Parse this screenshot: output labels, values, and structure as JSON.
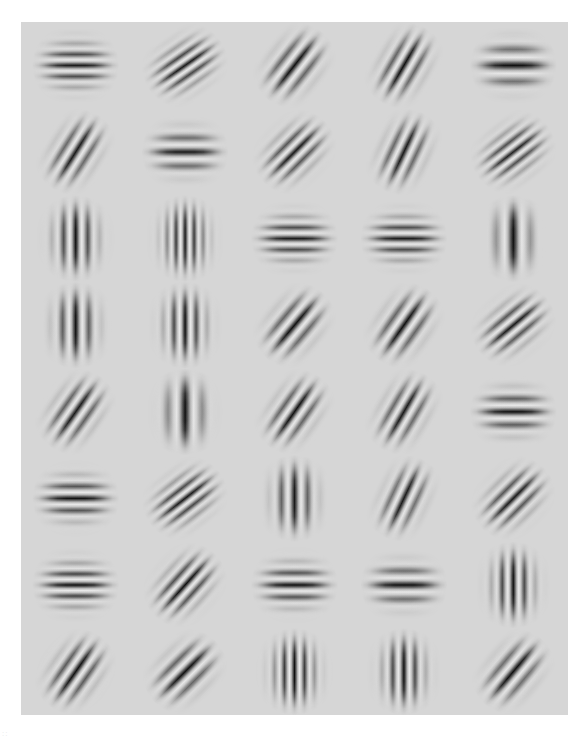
{
  "figure": {
    "kind": "gabor-filter-bank",
    "panel_background": "#d6d6d6",
    "page_background": "#ffffff",
    "panel": {
      "x": 21,
      "y": 22,
      "width": 547,
      "height": 693
    },
    "corner_mark": "::"
  },
  "chart_data": {
    "type": "heatmap",
    "title": "",
    "subtitle": "",
    "xlabel": "",
    "ylabel": "",
    "grid": false,
    "legend": "none",
    "rows": 8,
    "cols": 5,
    "cell_width": 109.4,
    "cell_height": 86.6,
    "patch_radius": 30,
    "background_level": 0.84,
    "orientation_units": "degrees (0 = horizontal bands, 90 = vertical bands, negative = bands tilted from lower-left to upper-right)",
    "patches": [
      {
        "row": 0,
        "col": 0,
        "orientation": 0,
        "bands": 5,
        "wavelength": 11,
        "sigma": 16,
        "amplitude": 0.95,
        "kind": "horizontal"
      },
      {
        "row": 0,
        "col": 1,
        "orientation": -35,
        "bands": 5,
        "wavelength": 10,
        "sigma": 15,
        "amplitude": 0.95,
        "kind": "oblique"
      },
      {
        "row": 0,
        "col": 2,
        "orientation": -52,
        "bands": 3,
        "wavelength": 13,
        "sigma": 14,
        "amplitude": 1.0,
        "kind": "oblique"
      },
      {
        "row": 0,
        "col": 3,
        "orientation": -60,
        "bands": 3,
        "wavelength": 12,
        "sigma": 13,
        "amplitude": 1.0,
        "kind": "oblique"
      },
      {
        "row": 0,
        "col": 4,
        "orientation": 0,
        "bands": 3,
        "wavelength": 16,
        "sigma": 16,
        "amplitude": 1.0,
        "kind": "horizontal"
      },
      {
        "row": 1,
        "col": 0,
        "orientation": -58,
        "bands": 3,
        "wavelength": 12,
        "sigma": 13,
        "amplitude": 0.95,
        "kind": "oblique"
      },
      {
        "row": 1,
        "col": 1,
        "orientation": 0,
        "bands": 3,
        "wavelength": 14,
        "sigma": 15,
        "amplitude": 0.95,
        "kind": "horizontal"
      },
      {
        "row": 1,
        "col": 2,
        "orientation": -45,
        "bands": 4,
        "wavelength": 11,
        "sigma": 14,
        "amplitude": 0.95,
        "kind": "oblique"
      },
      {
        "row": 1,
        "col": 3,
        "orientation": -65,
        "bands": 3,
        "wavelength": 12,
        "sigma": 13,
        "amplitude": 0.95,
        "kind": "oblique"
      },
      {
        "row": 1,
        "col": 4,
        "orientation": -38,
        "bands": 5,
        "wavelength": 10,
        "sigma": 15,
        "amplitude": 0.9,
        "kind": "oblique"
      },
      {
        "row": 2,
        "col": 0,
        "orientation": 90,
        "bands": 4,
        "wavelength": 12,
        "sigma": 16,
        "amplitude": 1.0,
        "kind": "vertical"
      },
      {
        "row": 2,
        "col": 1,
        "orientation": 90,
        "bands": 6,
        "wavelength": 9,
        "sigma": 16,
        "amplitude": 0.95,
        "kind": "vertical"
      },
      {
        "row": 2,
        "col": 2,
        "orientation": 0,
        "bands": 5,
        "wavelength": 11,
        "sigma": 16,
        "amplitude": 0.95,
        "kind": "horizontal"
      },
      {
        "row": 2,
        "col": 3,
        "orientation": 0,
        "bands": 5,
        "wavelength": 11,
        "sigma": 16,
        "amplitude": 0.95,
        "kind": "horizontal"
      },
      {
        "row": 2,
        "col": 4,
        "orientation": 90,
        "bands": 2,
        "wavelength": 17,
        "sigma": 13,
        "amplitude": 1.0,
        "kind": "vertical"
      },
      {
        "row": 3,
        "col": 0,
        "orientation": 90,
        "bands": 3,
        "wavelength": 13,
        "sigma": 15,
        "amplitude": 1.0,
        "kind": "vertical"
      },
      {
        "row": 3,
        "col": 1,
        "orientation": 90,
        "bands": 4,
        "wavelength": 11,
        "sigma": 15,
        "amplitude": 1.0,
        "kind": "vertical"
      },
      {
        "row": 3,
        "col": 2,
        "orientation": -50,
        "bands": 3,
        "wavelength": 13,
        "sigma": 14,
        "amplitude": 1.0,
        "kind": "oblique"
      },
      {
        "row": 3,
        "col": 3,
        "orientation": -55,
        "bands": 3,
        "wavelength": 13,
        "sigma": 14,
        "amplitude": 1.0,
        "kind": "oblique"
      },
      {
        "row": 3,
        "col": 4,
        "orientation": -40,
        "bands": 4,
        "wavelength": 11,
        "sigma": 14,
        "amplitude": 0.95,
        "kind": "oblique"
      },
      {
        "row": 4,
        "col": 0,
        "orientation": -55,
        "bands": 3,
        "wavelength": 12,
        "sigma": 14,
        "amplitude": 0.95,
        "kind": "oblique"
      },
      {
        "row": 4,
        "col": 1,
        "orientation": 90,
        "bands": 2,
        "wavelength": 17,
        "sigma": 14,
        "amplitude": 1.0,
        "kind": "vertical"
      },
      {
        "row": 4,
        "col": 2,
        "orientation": -55,
        "bands": 3,
        "wavelength": 12,
        "sigma": 13,
        "amplitude": 1.0,
        "kind": "oblique"
      },
      {
        "row": 4,
        "col": 3,
        "orientation": -60,
        "bands": 3,
        "wavelength": 12,
        "sigma": 13,
        "amplitude": 0.95,
        "kind": "oblique"
      },
      {
        "row": 4,
        "col": 4,
        "orientation": 0,
        "bands": 4,
        "wavelength": 13,
        "sigma": 15,
        "amplitude": 1.0,
        "kind": "horizontal"
      },
      {
        "row": 5,
        "col": 0,
        "orientation": 0,
        "bands": 4,
        "wavelength": 12,
        "sigma": 15,
        "amplitude": 1.0,
        "kind": "horizontal"
      },
      {
        "row": 5,
        "col": 1,
        "orientation": -38,
        "bands": 5,
        "wavelength": 10,
        "sigma": 15,
        "amplitude": 0.95,
        "kind": "oblique"
      },
      {
        "row": 5,
        "col": 2,
        "orientation": 90,
        "bands": 3,
        "wavelength": 13,
        "sigma": 15,
        "amplitude": 0.95,
        "kind": "vertical"
      },
      {
        "row": 5,
        "col": 3,
        "orientation": -65,
        "bands": 3,
        "wavelength": 12,
        "sigma": 12,
        "amplitude": 0.95,
        "kind": "oblique"
      },
      {
        "row": 5,
        "col": 4,
        "orientation": -45,
        "bands": 4,
        "wavelength": 11,
        "sigma": 14,
        "amplitude": 0.95,
        "kind": "oblique"
      },
      {
        "row": 6,
        "col": 0,
        "orientation": 0,
        "bands": 5,
        "wavelength": 11,
        "sigma": 16,
        "amplitude": 1.0,
        "kind": "horizontal"
      },
      {
        "row": 6,
        "col": 1,
        "orientation": -48,
        "bands": 4,
        "wavelength": 11,
        "sigma": 14,
        "amplitude": 1.0,
        "kind": "oblique"
      },
      {
        "row": 6,
        "col": 2,
        "orientation": 0,
        "bands": 4,
        "wavelength": 12,
        "sigma": 15,
        "amplitude": 1.0,
        "kind": "horizontal"
      },
      {
        "row": 6,
        "col": 3,
        "orientation": 0,
        "bands": 3,
        "wavelength": 14,
        "sigma": 14,
        "amplitude": 1.0,
        "kind": "horizontal"
      },
      {
        "row": 6,
        "col": 4,
        "orientation": 90,
        "bands": 4,
        "wavelength": 11,
        "sigma": 15,
        "amplitude": 1.0,
        "kind": "vertical"
      },
      {
        "row": 7,
        "col": 0,
        "orientation": -55,
        "bands": 3,
        "wavelength": 12,
        "sigma": 14,
        "amplitude": 1.0,
        "kind": "oblique"
      },
      {
        "row": 7,
        "col": 1,
        "orientation": -45,
        "bands": 3,
        "wavelength": 13,
        "sigma": 14,
        "amplitude": 1.0,
        "kind": "oblique"
      },
      {
        "row": 7,
        "col": 2,
        "orientation": 90,
        "bands": 5,
        "wavelength": 10,
        "sigma": 16,
        "amplitude": 1.0,
        "kind": "vertical"
      },
      {
        "row": 7,
        "col": 3,
        "orientation": 90,
        "bands": 4,
        "wavelength": 11,
        "sigma": 15,
        "amplitude": 1.0,
        "kind": "vertical"
      },
      {
        "row": 7,
        "col": 4,
        "orientation": -50,
        "bands": 3,
        "wavelength": 13,
        "sigma": 13,
        "amplitude": 1.0,
        "kind": "oblique"
      }
    ]
  }
}
